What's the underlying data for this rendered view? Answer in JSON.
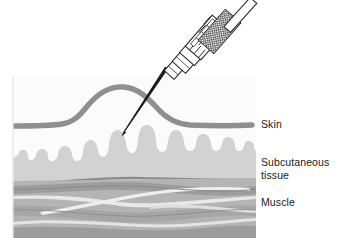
{
  "figure": {
    "type": "medical-illustration",
    "width": 339,
    "height": 238,
    "background_color": "#ffffff"
  },
  "labels": {
    "skin": "Skin",
    "subcutaneous_line1": "Subcutaneous",
    "subcutaneous_line2": "tissue",
    "muscle": "Muscle"
  },
  "anatomy": {
    "layers": [
      {
        "name": "skin",
        "label": "Skin",
        "color": "#8f8f8f"
      },
      {
        "name": "subcutaneous-tissue",
        "label": "Subcutaneous tissue",
        "color": "#d2d2d2"
      },
      {
        "name": "fascia",
        "label": "Fascia",
        "color": "#8a8a8a"
      },
      {
        "name": "muscle",
        "label": "Muscle",
        "color": "#b4b4b4"
      }
    ]
  },
  "instrument": {
    "name": "syringe",
    "parts": [
      {
        "name": "plunger-rod",
        "color": "#ffffff"
      },
      {
        "name": "barrel",
        "color": "#ffffff"
      },
      {
        "name": "graduation-marks",
        "color": "#2a2a2a"
      },
      {
        "name": "hub",
        "color": "#ffffff"
      },
      {
        "name": "needle",
        "color": "#1a1a1a"
      }
    ]
  },
  "colors": {
    "skin_line": "#8f8f8f",
    "subcutaneous_fill": "#d2d2d2",
    "subcutaneous_bg": "#fafafa",
    "muscle_fill": "#b4b4b4",
    "muscle_highlight": "#e6e6e6",
    "muscle_shadow": "#9a9a9a",
    "fascia": "#8a8a8a",
    "needle": "#1a1a1a",
    "outline": "#2a2a2a",
    "text": "#1a1a1a"
  }
}
